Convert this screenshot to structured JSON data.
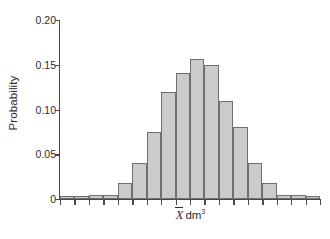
{
  "chart_data": {
    "type": "bar",
    "title": "",
    "subtitle": "",
    "xlabel": "X̅ dm³",
    "xlabel_parts": {
      "variable": "X",
      "overbar": true,
      "unit": "dm",
      "unit_exponent": "3"
    },
    "ylabel": "Probability",
    "ylim": [
      0,
      0.2
    ],
    "ytick_labels": [
      "0",
      "0.05",
      "0.10",
      "0.15",
      "0.20"
    ],
    "ytick_values": [
      0,
      0.05,
      0.1,
      0.15,
      0.2
    ],
    "grid": false,
    "legend": false,
    "legend_position": "none",
    "bar_fill_color": "#cbcbcb",
    "bar_border_color": "#6f6f6f",
    "axis_color": "#4a4a4a",
    "text_color": "#2b2b2b",
    "background_color": "#ffffff",
    "n_bins": 18,
    "categories": [
      "1",
      "2",
      "3",
      "4",
      "5",
      "6",
      "7",
      "8",
      "9",
      "10",
      "11",
      "12",
      "13",
      "14",
      "15",
      "16",
      "17",
      "18"
    ],
    "values": [
      0.003,
      0.003,
      0.005,
      0.005,
      0.018,
      0.04,
      0.075,
      0.12,
      0.141,
      0.156,
      0.15,
      0.109,
      0.081,
      0.04,
      0.018,
      0.005,
      0.005,
      0.003
    ],
    "series": [
      {
        "name": "Probability",
        "values": [
          0.003,
          0.003,
          0.005,
          0.005,
          0.018,
          0.04,
          0.075,
          0.12,
          0.141,
          0.156,
          0.15,
          0.109,
          0.081,
          0.04,
          0.018,
          0.005,
          0.005,
          0.003
        ]
      }
    ],
    "peak_value": 0.156,
    "peak_bin_index": 9,
    "n_xticks": 19,
    "annotations": []
  }
}
